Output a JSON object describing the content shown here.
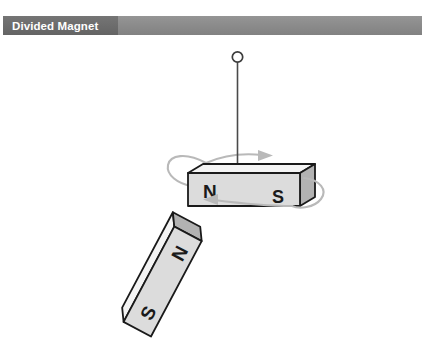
{
  "header": {
    "title": "Divided Magnet",
    "bar_color": "#8a8a8a",
    "title_block_color": "#6b6b6b",
    "title_text_color": "#ffffff"
  },
  "figure": {
    "background_color": "#ffffff",
    "width": 425,
    "height": 349,
    "magnet_face_color": "#dcdcdc",
    "magnet_top_color": "#f2f2f2",
    "magnet_side_color": "#a8a8a8",
    "magnet_outline_color": "#1a1a1a",
    "arrow_color": "#b0b0b0",
    "string_color": "#4a4a4a"
  },
  "suspension": {
    "ring_label": "suspension-ring",
    "string_label": "suspension-string"
  },
  "hanging_magnet": {
    "name": "hanging-bar-magnet",
    "north_pole_label": "N",
    "south_pole_label": "S"
  },
  "tilted_magnet": {
    "name": "tilted-bar-magnet",
    "north_pole_label": "N",
    "south_pole_label": "S",
    "rotation_degrees": -62
  },
  "rotation_indicator": {
    "name": "rotation-arrow-loop",
    "top_arrow_direction": "right",
    "bottom_arrow_direction": "left"
  }
}
